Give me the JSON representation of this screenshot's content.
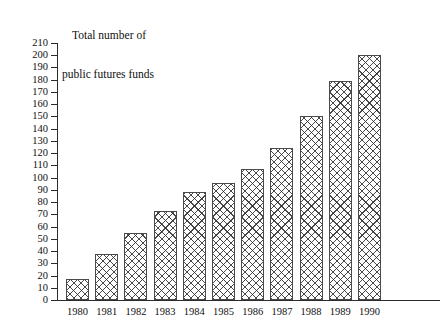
{
  "chart_data": {
    "type": "bar",
    "title": "Total number of public futures funds",
    "title_lines": [
      "Total number of",
      "public futures funds"
    ],
    "xlabel": "",
    "ylabel": "Total number of public futures funds",
    "categories": [
      "1980",
      "1981",
      "1982",
      "1983",
      "1984",
      "1985",
      "1986",
      "1987",
      "1988",
      "1989",
      "1990"
    ],
    "values": [
      17,
      38,
      55,
      73,
      88,
      96,
      107,
      124,
      150,
      179,
      200
    ],
    "ylim": [
      0,
      210
    ],
    "ytick_step": 10,
    "yticks": [
      0,
      10,
      20,
      30,
      40,
      50,
      60,
      70,
      80,
      90,
      100,
      110,
      120,
      130,
      140,
      150,
      160,
      170,
      180,
      190,
      200,
      210
    ],
    "ytick_labels": [
      "0",
      "10",
      "20",
      "30",
      "40",
      "50",
      "60",
      "70",
      "80",
      "90",
      "100",
      "110",
      "120",
      "130",
      "140",
      "150",
      "160",
      "170",
      "180",
      "190",
      "200",
      "210"
    ],
    "grid": false,
    "legend": false,
    "legend_position": "none",
    "bar_fill": "crosshatch",
    "bar_edge_color": "#4a4a4a",
    "bar_face_color": "#ffffff",
    "axis_color": "#2b2b2b",
    "background_color": "#ffffff"
  }
}
